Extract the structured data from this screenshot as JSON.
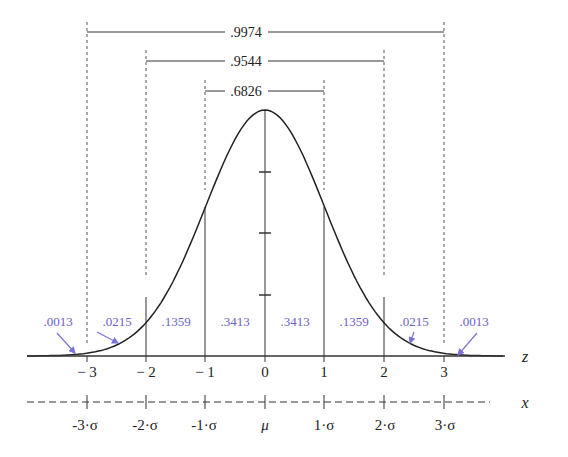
{
  "chart_data": {
    "type": "line",
    "xlabel": "z",
    "x2label": "x",
    "curve": "normal pdf, mean 0, sd 1",
    "z_ticks": [
      -3,
      -2,
      -1,
      0,
      1,
      2,
      3
    ],
    "z_tick_labels": [
      "− 3",
      "− 2",
      "− 1",
      "0",
      "1",
      "2",
      "3"
    ],
    "x_tick_labels": [
      "-3·σ",
      "-2·σ",
      "-1·σ",
      "μ",
      "1·σ",
      "2·σ",
      "3·σ"
    ],
    "regions": [
      {
        "from": "-inf",
        "to": -3,
        "area": ".0013"
      },
      {
        "from": -3,
        "to": -2,
        "area": ".0215"
      },
      {
        "from": -2,
        "to": -1,
        "area": ".1359"
      },
      {
        "from": -1,
        "to": 0,
        "area": ".3413"
      },
      {
        "from": 0,
        "to": 1,
        "area": ".3413"
      },
      {
        "from": 1,
        "to": 2,
        "area": ".1359"
      },
      {
        "from": 2,
        "to": 3,
        "area": ".0215"
      },
      {
        "from": 3,
        "to": "inf",
        "area": ".0013"
      }
    ],
    "brackets": [
      {
        "from": -3,
        "to": 3,
        "area": ".9974"
      },
      {
        "from": -2,
        "to": 2,
        "area": ".9544"
      },
      {
        "from": -1,
        "to": 1,
        "area": ".6826"
      }
    ],
    "colors": {
      "curve": "#222222",
      "region_labels": "#6b62c8",
      "arrows": "#7b72d8"
    },
    "grid": false,
    "legend": null
  },
  "labels": {
    "bracket_0": ".9974",
    "bracket_1": ".9544",
    "bracket_2": ".6826",
    "region_0": ".0013",
    "region_1": ".0215",
    "region_2": ".1359",
    "region_3": ".3413",
    "region_4": ".3413",
    "region_5": ".1359",
    "region_6": ".0215",
    "region_7": ".0013",
    "z_0": "− 3",
    "z_1": "− 2",
    "z_2": "− 1",
    "z_3": "0",
    "z_4": "1",
    "z_5": "2",
    "z_6": "3",
    "x_0": "-3·σ",
    "x_1": "-2·σ",
    "x_2": "-1·σ",
    "x_3": "μ",
    "x_4": "1·σ",
    "x_5": "2·σ",
    "x_6": "3·σ",
    "z_axis_name": "z",
    "x_axis_name": "x"
  }
}
